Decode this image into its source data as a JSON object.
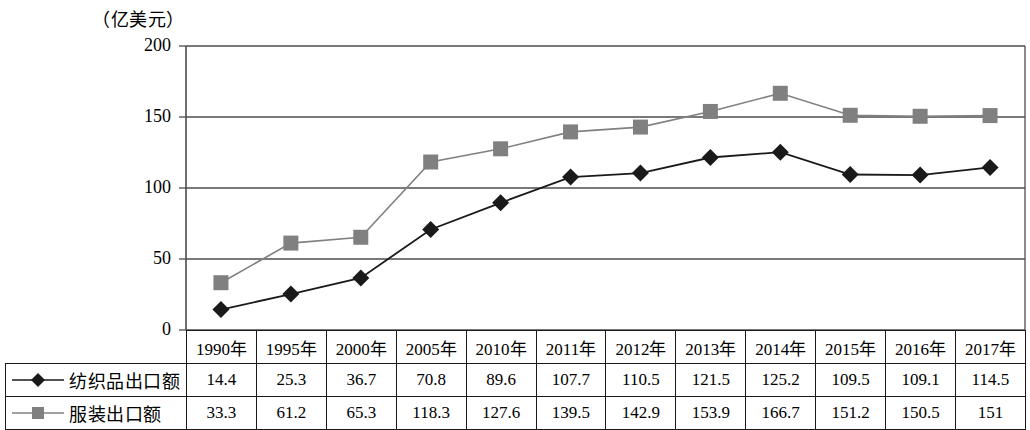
{
  "unit_label": "（亿美元）",
  "chart_data": {
    "type": "line",
    "title": "",
    "xlabel": "",
    "ylabel": "亿美元",
    "ylim": [
      0,
      200
    ],
    "yticks": [
      0,
      50,
      100,
      150,
      200
    ],
    "grid": true,
    "legend_position": "table-left",
    "categories": [
      "1990年",
      "1995年",
      "2000年",
      "2005年",
      "2010年",
      "2011年",
      "2012年",
      "2013年",
      "2014年",
      "2015年",
      "2016年",
      "2017年"
    ],
    "series": [
      {
        "name": "纺织品出口额",
        "marker": "diamond",
        "color": "#1a1a1a",
        "values": [
          14.4,
          25.3,
          36.7,
          70.8,
          89.6,
          107.7,
          110.5,
          121.5,
          125.2,
          109.5,
          109.1,
          114.5
        ]
      },
      {
        "name": "服装出口额",
        "marker": "square",
        "color": "#808080",
        "values": [
          33.3,
          61.2,
          65.3,
          118.3,
          127.6,
          139.5,
          142.9,
          153.9,
          166.7,
          151.2,
          150.5,
          151
        ]
      }
    ]
  },
  "table": {
    "header_corner": "",
    "columns": [
      "1990年",
      "1995年",
      "2000年",
      "2005年",
      "2010年",
      "2011年",
      "2012年",
      "2013年",
      "2014年",
      "2015年",
      "2016年",
      "2017年"
    ],
    "rows": [
      {
        "label": "纺织品出口额",
        "marker": "diamond",
        "color": "#1a1a1a",
        "values": [
          "14.4",
          "25.3",
          "36.7",
          "70.8",
          "89.6",
          "107.7",
          "110.5",
          "121.5",
          "125.2",
          "109.5",
          "109.1",
          "114.5"
        ]
      },
      {
        "label": "服装出口额",
        "marker": "square",
        "color": "#808080",
        "values": [
          "33.3",
          "61.2",
          "65.3",
          "118.3",
          "127.6",
          "139.5",
          "142.9",
          "153.9",
          "166.7",
          "151.2",
          "150.5",
          "151"
        ]
      }
    ]
  },
  "colors": {
    "textile_line": "#1a1a1a",
    "apparel_line": "#808080",
    "axis": "#4d4d4d",
    "grid": "#4d4d4d",
    "background": "#ffffff"
  }
}
